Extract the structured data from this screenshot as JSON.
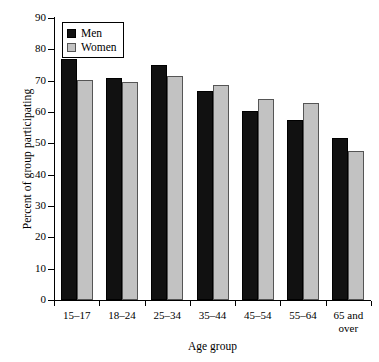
{
  "chart_data": {
    "type": "bar",
    "title": "",
    "subtitle": "",
    "xlabel": "Age group",
    "ylabel": "Percent of group participating",
    "categories": [
      "15–17",
      "18–24",
      "25–34",
      "35–44",
      "45–54",
      "55–64",
      "65 and over"
    ],
    "category_lines": [
      [
        "15–17"
      ],
      [
        "18–24"
      ],
      [
        "25–34"
      ],
      [
        "35–44"
      ],
      [
        "45–54"
      ],
      [
        "55–64"
      ],
      [
        "65 and",
        "over"
      ]
    ],
    "series": [
      {
        "name": "Men",
        "color": "#111111",
        "values": [
          77.0,
          71.0,
          75.0,
          66.7,
          60.3,
          57.4,
          51.6
        ]
      },
      {
        "name": "Women",
        "color": "#c2c2c2",
        "values": [
          70.2,
          69.5,
          71.5,
          68.6,
          64.0,
          63.0,
          47.5
        ]
      }
    ],
    "ylim": [
      0,
      90
    ],
    "ytick_values": [
      0,
      10,
      20,
      30,
      40,
      50,
      60,
      70,
      80,
      90
    ],
    "ytick_labels": [
      "0",
      "10",
      "20",
      "30",
      "40",
      "50",
      "60",
      "70",
      "80",
      "90"
    ],
    "grid": false,
    "legend_position": "upper left",
    "legend_entries": [
      "Men",
      "Women"
    ],
    "orientation": "vertical",
    "grouping": "grouped"
  },
  "legend": {
    "men_label": "Men",
    "women_label": "Women"
  },
  "axes": {
    "x_title": "Age group",
    "y_title": "Percent of group participating"
  }
}
